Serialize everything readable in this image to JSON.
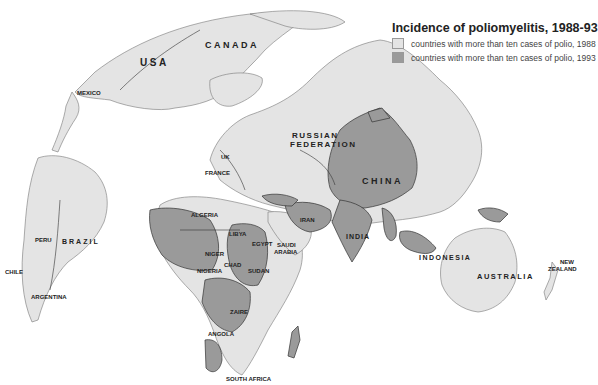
{
  "legend": {
    "title": "Incidence of poliomyelitis, 1988-93",
    "items": [
      {
        "label": "countries with more than ten cases of polio, 1988",
        "color": "#e4e4e4"
      },
      {
        "label": "countries with more than ten cases of polio, 1993",
        "color": "#9a9a9a"
      }
    ]
  },
  "colors": {
    "ocean": "#ffffff",
    "land_light": "#e4e4e4",
    "land_dark": "#9a9a9a",
    "border": "#333333"
  },
  "labels": {
    "canada": "CANADA",
    "usa": "USA",
    "mexico": "MEXICO",
    "russian_federation_1": "RUSSIAN",
    "russian_federation_2": "FEDERATION",
    "uk": "UK",
    "france": "FRANCE",
    "china": "CHINA",
    "iran": "IRAN",
    "india": "INDIA",
    "indonesia": "INDONESIA",
    "australia": "AUSTRALIA",
    "new_zealand_1": "NEW",
    "new_zealand_2": "ZEALAND",
    "algeria": "ALGERIA",
    "libya": "LIBYA",
    "egypt": "EGYPT",
    "saudi_arabia_1": "SAUDI",
    "saudi_arabia_2": "ARABIA",
    "niger": "NIGER",
    "chad": "CHAD",
    "nigeria": "NIGERIA",
    "sudan": "SUDAN",
    "zaire": "ZAIRE",
    "angola": "ANGOLA",
    "south_africa": "SOUTH AFRICA",
    "peru": "PERU",
    "brazil": "BRAZIL",
    "chile": "CHILE",
    "argentina": "ARGENTINA"
  }
}
